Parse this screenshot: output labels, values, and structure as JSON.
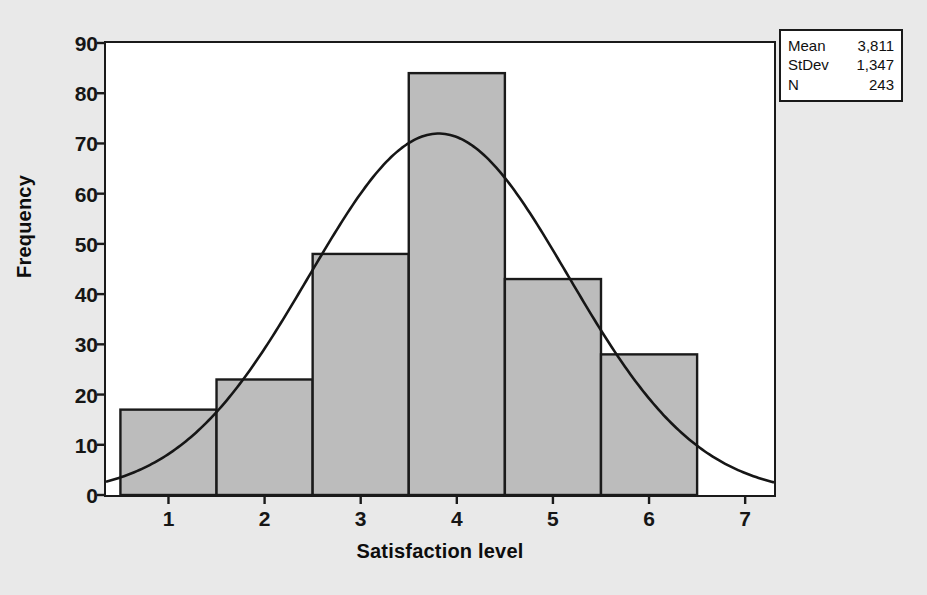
{
  "chart_data": {
    "type": "bar",
    "title": "",
    "xlabel": "Satisfaction level",
    "ylabel": "Frequency",
    "categories": [
      "1",
      "2",
      "3",
      "4",
      "5",
      "6"
    ],
    "values": [
      17,
      23,
      48,
      84,
      43,
      28
    ],
    "bin_edges": [
      0.5,
      1.5,
      2.5,
      3.5,
      4.5,
      5.5,
      6.5
    ],
    "xlim": [
      0.35,
      7.3
    ],
    "ylim": [
      0,
      90
    ],
    "ytick_labels": [
      "0",
      "10",
      "20",
      "30",
      "40",
      "50",
      "60",
      "70",
      "80",
      "90"
    ],
    "ytick_values": [
      0,
      10,
      20,
      30,
      40,
      50,
      60,
      70,
      80,
      90
    ],
    "xtick_labels": [
      "1",
      "2",
      "3",
      "4",
      "5",
      "6",
      "7"
    ],
    "xtick_values": [
      1,
      2,
      3,
      4,
      5,
      6,
      7
    ],
    "grid": false,
    "legend_position": "top-right-outside",
    "overlay": {
      "type": "line",
      "name": "normal-curve",
      "mean": 3.811,
      "stdev": 1.347,
      "n": 243,
      "bin_width": 1,
      "peak_value": 72
    },
    "bar_fill_color": "#bcbcbc",
    "bar_edge_color": "#1a1a1a",
    "curve_color": "#161616",
    "plot_background": "#ffffff",
    "page_background": "#e9e9e9"
  },
  "stats_box": {
    "rows": [
      {
        "label": "Mean",
        "value": "3,811"
      },
      {
        "label": "StDev",
        "value": "1,347"
      },
      {
        "label": "N",
        "value": "243"
      }
    ]
  },
  "axis_titles": {
    "x": "Satisfaction level",
    "y": "Frequency"
  }
}
